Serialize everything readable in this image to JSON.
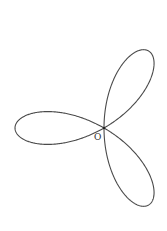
{
  "figure": {
    "type": "polar-rose-curve",
    "petals": 3,
    "origin_label": "O",
    "origin_px": [
      104,
      128
    ],
    "petal_length_px": 89,
    "petal_directions_deg": [
      180,
      60,
      -60
    ],
    "stroke_color": "#4a4a4a",
    "background": "#ffffff"
  }
}
